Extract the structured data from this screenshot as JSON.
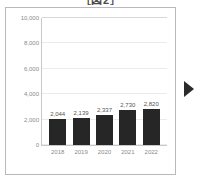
{
  "title": "［図2］",
  "chart_data": {
    "type": "bar",
    "title": "［図2］",
    "xlabel": "",
    "ylabel": "",
    "categories": [
      "2018",
      "2019",
      "2020",
      "2021",
      "2022"
    ],
    "values": [
      2044,
      2139,
      2337,
      2730,
      2820
    ],
    "value_labels": [
      "2,044",
      "2,139",
      "2,337",
      "2,730",
      "2,820"
    ],
    "ylim": [
      0,
      10000
    ],
    "yticks": [
      0,
      2000,
      4000,
      6000,
      8000,
      10000
    ],
    "ytick_labels": [
      "0",
      "2,000",
      "4,000",
      "6,000",
      "8,000",
      "10,000"
    ],
    "grid": true,
    "legend": null,
    "bar_color": "#262626",
    "gridline_color": "#ebebeb",
    "axis_color": "#c8c8c8",
    "tick_label_color": "#8a8a8a",
    "data_label_color": "#555555"
  },
  "controls": {
    "next_arrow": "play-arrow"
  }
}
